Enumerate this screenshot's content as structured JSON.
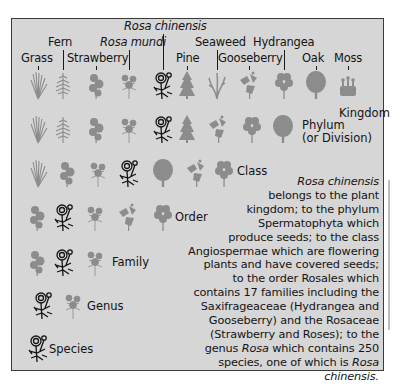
{
  "diagram": {
    "title_species": "Rosa chinensis",
    "plant_labels": [
      {
        "id": "grass",
        "label": "Grass"
      },
      {
        "id": "fern",
        "label": "Fern"
      },
      {
        "id": "strawberry",
        "label": "Strawberry"
      },
      {
        "id": "rosa_mundi",
        "label": "Rosa mundi"
      },
      {
        "id": "rosa_chinensis",
        "label": "Rosa chinensis"
      },
      {
        "id": "pine",
        "label": "Pine"
      },
      {
        "id": "seaweed",
        "label": "Seaweed"
      },
      {
        "id": "gooseberry",
        "label": "Gooseberry"
      },
      {
        "id": "hydrangea",
        "label": "Hydrangea"
      },
      {
        "id": "oak",
        "label": "Oak"
      },
      {
        "id": "moss",
        "label": "Moss"
      }
    ],
    "ranks": [
      {
        "name": "Kingdom",
        "members": [
          "grass",
          "fern",
          "strawberry",
          "rosa_mundi",
          "rosa_chinensis",
          "pine",
          "seaweed",
          "gooseberry",
          "hydrangea",
          "oak",
          "moss"
        ]
      },
      {
        "name": "Phylum",
        "sub": "(or Division)",
        "members": [
          "grass",
          "fern",
          "strawberry",
          "rosa_mundi",
          "rosa_chinensis",
          "pine",
          "gooseberry",
          "hydrangea",
          "oak"
        ]
      },
      {
        "name": "Class",
        "members": [
          "grass",
          "strawberry",
          "rosa_mundi",
          "rosa_chinensis",
          "oak",
          "gooseberry",
          "hydrangea"
        ]
      },
      {
        "name": "Order",
        "members": [
          "strawberry",
          "rosa_chinensis",
          "rosa_mundi",
          "gooseberry",
          "hydrangea"
        ]
      },
      {
        "name": "Family",
        "members": [
          "strawberry",
          "rosa_chinensis",
          "rosa_mundi"
        ]
      },
      {
        "name": "Genus",
        "members": [
          "rosa_chinensis",
          "rosa_mundi"
        ]
      },
      {
        "name": "Species",
        "members": [
          "rosa_chinensis"
        ]
      }
    ],
    "description": {
      "lines": [
        {
          "parts": [
            {
              "t": "Rosa chinensis",
              "i": true
            }
          ]
        },
        {
          "parts": [
            {
              "t": "belongs to the plant"
            }
          ]
        },
        {
          "parts": [
            {
              "t": "kingdom; to the phylum"
            }
          ]
        },
        {
          "parts": [
            {
              "t": "Spermatophyta which"
            }
          ]
        },
        {
          "parts": [
            {
              "t": "produce seeds; to the class"
            }
          ]
        },
        {
          "parts": [
            {
              "t": "Angiospermae which are flowering"
            }
          ]
        },
        {
          "parts": [
            {
              "t": "plants and have covered seeds;"
            }
          ]
        },
        {
          "parts": [
            {
              "t": "to the order Rosales which"
            }
          ]
        },
        {
          "parts": [
            {
              "t": "contains 17 families including the"
            }
          ]
        },
        {
          "parts": [
            {
              "t": "Saxifrageaceae (Hydrangea and"
            }
          ]
        },
        {
          "parts": [
            {
              "t": "Gooseberry) and the Rosaceae"
            }
          ]
        },
        {
          "parts": [
            {
              "t": "(Strawberry and Roses); to the"
            }
          ]
        },
        {
          "parts": [
            {
              "t": "genus "
            },
            {
              "t": "Rosa",
              "i": true
            },
            {
              "t": " which contains 250"
            }
          ]
        },
        {
          "parts": [
            {
              "t": "species, one of which is "
            },
            {
              "t": "Rosa",
              "i": true
            }
          ]
        },
        {
          "parts": [
            {
              "t": "chinensis.",
              "i": true
            }
          ]
        }
      ]
    },
    "colors": {
      "panel_bg": "#d6d6d6",
      "border": "#3a3a3a",
      "icon_grey": "#8c8c8c",
      "icon_dark": "#141414",
      "text": "#141414"
    }
  }
}
